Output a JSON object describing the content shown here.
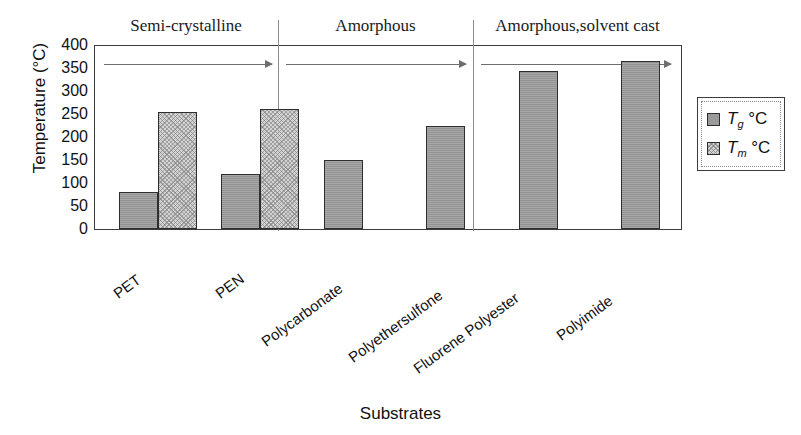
{
  "chart_data": {
    "type": "bar",
    "title": "",
    "xlabel": "Substrates",
    "ylabel": "Temperature (°C)",
    "categories": [
      "PET",
      "PEN",
      "Polycarbonate",
      "Polyethersulfone",
      "Fluorene Polyester",
      "Polyimide"
    ],
    "series": [
      {
        "name": "Tg °C",
        "values": [
          80,
          120,
          150,
          223,
          343,
          365
        ]
      },
      {
        "name": "Tm °C",
        "values": [
          255,
          262,
          null,
          null,
          null,
          null
        ]
      }
    ],
    "ylim": [
      0,
      400
    ],
    "ytick_labels": [
      "400",
      "350",
      "300",
      "250",
      "200",
      "150",
      "100",
      "50",
      "0"
    ],
    "ytick_values": [
      400,
      350,
      300,
      250,
      200,
      150,
      100,
      50,
      0
    ],
    "grid": false,
    "legend_position": "right",
    "groups": [
      {
        "label": "Semi-crystalline",
        "members": [
          "PET",
          "PEN"
        ]
      },
      {
        "label": "Amorphous",
        "members": [
          "Polycarbonate",
          "Polyethersulfone"
        ]
      },
      {
        "label": "Amorphous,solvent cast",
        "members": [
          "Fluorene Polyester",
          "Polyimide"
        ]
      }
    ],
    "colors": {
      "tg_fill": "#9a9a9a",
      "tm_fill": "#d2d2d2",
      "bar_border": "#2e2e2e",
      "axis": "#3c3c3c",
      "group_rule": "#6e6e6e",
      "background": "#ffffff"
    }
  },
  "legend": {
    "items": [
      {
        "symbol": "T",
        "sub": "g",
        "unit": "°C",
        "swatch": "tg"
      },
      {
        "symbol": "T",
        "sub": "m",
        "unit": "°C",
        "swatch": "tm"
      }
    ]
  }
}
